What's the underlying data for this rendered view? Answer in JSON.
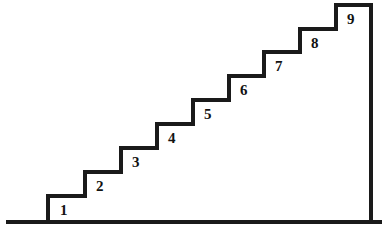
{
  "figure": {
    "background_color": "#ffffff",
    "stroke_color": "#1a1a1a",
    "label_color": "#121212",
    "width": 387,
    "height": 234
  },
  "geometry": {
    "ground_line": {
      "x1": 8,
      "x2": 380,
      "y": 222,
      "thickness": 4
    },
    "right_wall": {
      "x": 371,
      "y_top": 5,
      "y_bottom": 222,
      "thickness": 4
    },
    "stair_stroke_thickness": 4,
    "tread_width": 36,
    "riser_height": 24,
    "first_riser_x": 48,
    "base_y": 222
  },
  "steps": [
    {
      "number": "1",
      "tread_y": 196,
      "x_start": 48,
      "x_end": 85,
      "label_x": 60,
      "label_y": 203
    },
    {
      "number": "2",
      "tread_y": 172,
      "x_start": 85,
      "x_end": 121,
      "label_x": 96,
      "label_y": 179
    },
    {
      "number": "3",
      "tread_y": 148,
      "x_start": 121,
      "x_end": 157,
      "label_x": 132,
      "label_y": 155
    },
    {
      "number": "4",
      "tread_y": 124,
      "x_start": 157,
      "x_end": 193,
      "label_x": 168,
      "label_y": 131
    },
    {
      "number": "5",
      "tread_y": 100,
      "x_start": 193,
      "x_end": 229,
      "label_x": 204,
      "label_y": 107
    },
    {
      "number": "6",
      "tread_y": 76,
      "x_start": 229,
      "x_end": 264,
      "label_x": 240,
      "label_y": 83
    },
    {
      "number": "7",
      "tread_y": 52,
      "x_start": 264,
      "x_end": 300,
      "label_x": 275,
      "label_y": 59
    },
    {
      "number": "8",
      "tread_y": 29,
      "x_start": 300,
      "x_end": 336,
      "label_x": 311,
      "label_y": 36
    },
    {
      "number": "9",
      "tread_y": 5,
      "x_start": 336,
      "x_end": 371,
      "label_x": 347,
      "label_y": 12
    }
  ],
  "path": {
    "staircase_outline": "M 48,222 L 48,196 L 85,196 L 85,172 L 121,172 L 121,148 L 157,148 L 157,124 L 193,124 L 193,100 L 229,100 L 229,76 L 264,76 L 264,52 L 300,52 L 300,29 L 336,29 L 336,5 L 371,5 L 371,222",
    "ground": "M 8,222 L 380,222"
  }
}
